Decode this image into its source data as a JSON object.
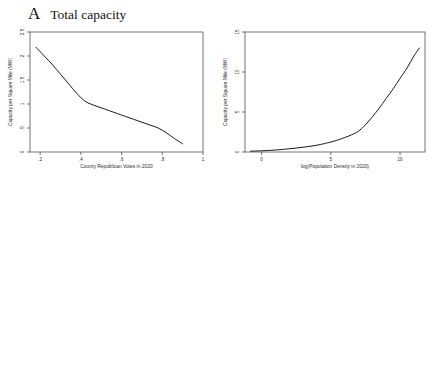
{
  "figure": {
    "panels": [
      {
        "letter": "A",
        "title": "Total capacity"
      },
      {
        "letter": "B",
        "title": "Green capacity"
      }
    ],
    "axis_titles": {
      "y": "Capacity per Square Mile (MW)",
      "x_republican": "County Republican Votes in 2020",
      "x_density": "log(Population Density in 2020)"
    },
    "legend": {
      "green": "Green capacity",
      "wind": "Wind capacity",
      "solar": "Solar capacity"
    }
  },
  "chart_data": [
    {
      "id": "a-left",
      "type": "line",
      "panel": "A",
      "title": "Total capacity",
      "xlabel": "County Republican Votes in 2020",
      "ylabel": "Capacity per Square Mile (MW)",
      "xlim": [
        0.15,
        1.0
      ],
      "ylim": [
        0,
        2.5
      ],
      "xticks": [
        0.2,
        0.4,
        0.6,
        0.8,
        1.0
      ],
      "xticklabels": [
        ".2",
        ".4",
        ".6",
        ".8",
        "1"
      ],
      "yticks": [
        0,
        0.5,
        1,
        1.5,
        2,
        2.5
      ],
      "yticklabels": [
        "0",
        ".5",
        "1",
        "1.5",
        "2",
        "2.5"
      ],
      "grid": false,
      "legend": "none",
      "series": [
        {
          "name": "Total capacity",
          "style": "solid",
          "x": [
            0.18,
            0.22,
            0.26,
            0.3,
            0.34,
            0.38,
            0.42,
            0.46,
            0.5,
            0.54,
            0.58,
            0.62,
            0.66,
            0.7,
            0.74,
            0.78,
            0.82,
            0.86,
            0.9
          ],
          "y": [
            2.18,
            2.0,
            1.82,
            1.62,
            1.42,
            1.22,
            1.06,
            0.98,
            0.92,
            0.86,
            0.8,
            0.74,
            0.68,
            0.62,
            0.56,
            0.5,
            0.4,
            0.28,
            0.17
          ]
        }
      ]
    },
    {
      "id": "a-right",
      "type": "line",
      "panel": "A",
      "title": "Total capacity",
      "xlabel": "log(Population Density in 2020)",
      "ylabel": "Capacity per Square Mile (MW)",
      "xlim": [
        -1.2,
        11.8
      ],
      "ylim": [
        0,
        15
      ],
      "xticks": [
        0,
        5,
        10
      ],
      "xticklabels": [
        "0",
        "5",
        "10"
      ],
      "yticks": [
        0,
        5,
        10,
        15
      ],
      "yticklabels": [
        "0",
        "5",
        "10",
        "15"
      ],
      "grid": false,
      "legend": "none",
      "series": [
        {
          "name": "Total capacity",
          "style": "solid",
          "x": [
            -0.8,
            0.0,
            1.0,
            2.0,
            3.0,
            4.0,
            5.0,
            5.5,
            6.0,
            6.5,
            7.0,
            7.5,
            8.0,
            8.5,
            9.0,
            9.5,
            10.0,
            10.5,
            11.0,
            11.4
          ],
          "y": [
            0.1,
            0.15,
            0.25,
            0.4,
            0.6,
            0.85,
            1.25,
            1.5,
            1.8,
            2.15,
            2.6,
            3.4,
            4.4,
            5.5,
            6.7,
            7.9,
            9.2,
            10.5,
            12.0,
            13.0
          ]
        }
      ]
    },
    {
      "id": "b-left",
      "type": "line",
      "panel": "B",
      "title": "Green capacity",
      "xlabel": "County Republican Votes in 2020",
      "ylabel": "Capacity per Square Mile (MW)",
      "xlim": [
        0.15,
        1.0
      ],
      "ylim": [
        0,
        0.08
      ],
      "xticks": [
        0.2,
        0.4,
        0.6,
        0.8,
        1.0
      ],
      "xticklabels": [
        ".2",
        ".4",
        ".6",
        ".8",
        "1"
      ],
      "yticks": [
        0,
        0.02,
        0.04,
        0.06,
        0.08
      ],
      "yticklabels": [
        "0",
        ".02",
        ".04",
        ".06",
        ".08"
      ],
      "grid": false,
      "legend": "bottom",
      "series": [
        {
          "name": "Green capacity",
          "style": "solid",
          "x": [
            0.18,
            0.22,
            0.26,
            0.3,
            0.34,
            0.38,
            0.42,
            0.46,
            0.5,
            0.54,
            0.58,
            0.62,
            0.66,
            0.7,
            0.74,
            0.78,
            0.82,
            0.86,
            0.89
          ],
          "y": [
            0.0405,
            0.047,
            0.053,
            0.0575,
            0.0605,
            0.0625,
            0.064,
            0.0648,
            0.066,
            0.0668,
            0.068,
            0.07,
            0.0688,
            0.0692,
            0.07,
            0.066,
            0.0622,
            0.0632,
            0.066
          ]
        },
        {
          "name": "Wind capacity",
          "style": "dashed",
          "x": [
            0.18,
            0.22,
            0.26,
            0.3,
            0.34,
            0.38,
            0.42,
            0.46,
            0.5,
            0.54,
            0.58,
            0.62,
            0.66,
            0.7,
            0.74,
            0.78,
            0.82,
            0.86,
            0.89
          ],
          "y": [
            0.002,
            0.006,
            0.01,
            0.014,
            0.018,
            0.0215,
            0.025,
            0.029,
            0.033,
            0.039,
            0.044,
            0.0455,
            0.052,
            0.057,
            0.052,
            0.046,
            0.043,
            0.045,
            0.047
          ]
        },
        {
          "name": "Solar capacity",
          "style": "light",
          "x": [
            0.18,
            0.22,
            0.26,
            0.3,
            0.34,
            0.38,
            0.42,
            0.46,
            0.5,
            0.54,
            0.58,
            0.62,
            0.66,
            0.7,
            0.74,
            0.78,
            0.82,
            0.86,
            0.89
          ],
          "y": [
            0.04,
            0.043,
            0.044,
            0.0443,
            0.044,
            0.043,
            0.0405,
            0.037,
            0.033,
            0.0285,
            0.024,
            0.0195,
            0.0155,
            0.0122,
            0.01,
            0.0092,
            0.0098,
            0.0115,
            0.013
          ]
        }
      ]
    },
    {
      "id": "b-right",
      "type": "line",
      "panel": "B",
      "title": "Green capacity",
      "xlabel": "log(Population Density in 2020)",
      "ylabel": "Capacity per Square Mile (MW)",
      "xlim": [
        -1.2,
        11.8
      ],
      "ylim": [
        0,
        0.1
      ],
      "xticks": [
        0,
        5,
        10
      ],
      "xticklabels": [
        "0",
        "5",
        "10"
      ],
      "yticks": [
        0,
        0.02,
        0.04,
        0.06,
        0.08,
        0.1
      ],
      "yticklabels": [
        "0",
        ".02",
        ".04",
        ".06",
        ".08",
        ".1"
      ],
      "grid": false,
      "legend": "bottom",
      "series": [
        {
          "name": "Green capacity",
          "style": "solid",
          "x": [
            -0.8,
            0.0,
            0.8,
            1.6,
            2.2,
            2.8,
            3.4,
            4.0,
            4.4,
            4.8,
            5.4,
            6.0,
            6.6,
            7.2,
            7.8,
            8.4,
            9.0,
            9.6,
            10.2,
            10.8,
            11.4
          ],
          "y": [
            0.07,
            0.076,
            0.084,
            0.089,
            0.088,
            0.084,
            0.078,
            0.07,
            0.066,
            0.062,
            0.058,
            0.056,
            0.055,
            0.0555,
            0.057,
            0.059,
            0.061,
            0.063,
            0.0655,
            0.0675,
            0.069
          ]
        },
        {
          "name": "Wind capacity",
          "style": "dashed",
          "x": [
            -0.8,
            0.0,
            0.8,
            1.6,
            2.2,
            2.8,
            3.4,
            4.0,
            4.4,
            4.8,
            5.4,
            6.0,
            6.6,
            7.2,
            7.8,
            8.4,
            9.0,
            9.6,
            10.2,
            10.8,
            11.4
          ],
          "y": [
            0.06,
            0.068,
            0.078,
            0.084,
            0.082,
            0.076,
            0.067,
            0.056,
            0.05,
            0.043,
            0.034,
            0.027,
            0.0215,
            0.017,
            0.0135,
            0.011,
            0.009,
            0.0072,
            0.0058,
            0.0045,
            0.0035
          ]
        },
        {
          "name": "Solar capacity",
          "style": "light",
          "x": [
            -0.8,
            0.0,
            0.8,
            1.6,
            2.2,
            2.8,
            3.4,
            4.0,
            4.4,
            4.8,
            5.4,
            6.0,
            6.6,
            7.2,
            7.8,
            8.4,
            9.0,
            9.6,
            10.2,
            10.8,
            11.4
          ],
          "y": [
            0.0105,
            0.0105,
            0.0112,
            0.013,
            0.015,
            0.0175,
            0.0205,
            0.024,
            0.0265,
            0.0295,
            0.034,
            0.0385,
            0.043,
            0.0472,
            0.0512,
            0.0548,
            0.058,
            0.0612,
            0.064,
            0.0665,
            0.0688
          ]
        }
      ]
    }
  ]
}
